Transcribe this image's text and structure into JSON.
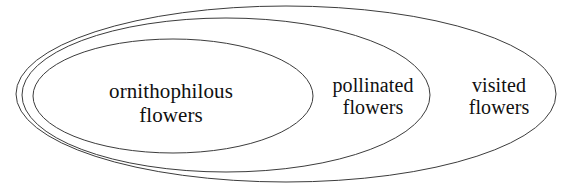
{
  "diagram": {
    "type": "euler-nested-sets",
    "background_color": "#ffffff",
    "stroke_color": "#3c3c3c",
    "text_color": "#101010",
    "canvas": {
      "width": 571,
      "height": 190
    },
    "sets": [
      {
        "id": "ornithophilous",
        "label_lines": [
          "ornithophilous",
          "flowers"
        ],
        "nesting_level": 1,
        "relation": "innermost subset",
        "ellipse": {
          "cx": 173,
          "cy": 96,
          "rx": 140,
          "ry": 57
        }
      },
      {
        "id": "pollinated",
        "label_lines": [
          "pollinated",
          "flowers"
        ],
        "nesting_level": 2,
        "relation": "contains ornithophilous flowers",
        "ellipse": {
          "cx": 226,
          "cy": 95,
          "rx": 204,
          "ry": 77
        }
      },
      {
        "id": "visited",
        "label_lines": [
          "visited",
          "flowers"
        ],
        "nesting_level": 3,
        "relation": "outermost superset; contains pollinated flowers",
        "ellipse": {
          "cx": 286,
          "cy": 94,
          "rx": 270,
          "ry": 88
        }
      }
    ]
  },
  "chart_data": {
    "type": "diagram",
    "subtype": "euler",
    "title": "",
    "categories": [
      "ornithophilous flowers",
      "pollinated flowers",
      "visited flowers"
    ],
    "nesting": "ornithophilous flowers ⊂ pollinated flowers ⊂ visited flowers",
    "legend": "",
    "annotations": [
      "ornithophilous flowers",
      "pollinated flowers",
      "visited flowers"
    ]
  }
}
